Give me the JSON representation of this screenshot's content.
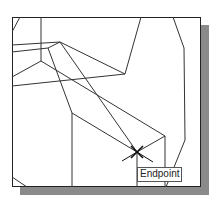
{
  "viewport": {
    "background": "#ffffff",
    "frame_color": "#222222",
    "shadow_color": "#8a8a8a"
  },
  "osnap": {
    "tooltip_label": "Endpoint",
    "cursor_icon": "snap-cross-cursor-icon"
  },
  "drawing": {
    "line_color": "#333333",
    "lines": [
      [
        41,
        17,
        41,
        61
      ],
      [
        20,
        17,
        12,
        32
      ],
      [
        12,
        45,
        60,
        42
      ],
      [
        12,
        52,
        48,
        48
      ],
      [
        48,
        48,
        60,
        42
      ],
      [
        41,
        61,
        12,
        77
      ],
      [
        41,
        61,
        165,
        136
      ],
      [
        48,
        48,
        72,
        113
      ],
      [
        72,
        113,
        72,
        187
      ],
      [
        72,
        113,
        137,
        152
      ],
      [
        60,
        42,
        125,
        74
      ],
      [
        125,
        74,
        141,
        17
      ],
      [
        60,
        42,
        137,
        152
      ],
      [
        12,
        86,
        125,
        74
      ],
      [
        173,
        17,
        184,
        48
      ],
      [
        184,
        48,
        185,
        140
      ],
      [
        185,
        140,
        166,
        187
      ],
      [
        165,
        136,
        165,
        187
      ],
      [
        165,
        136,
        137,
        152
      ],
      [
        137,
        152,
        137,
        187
      ],
      [
        12,
        177,
        27,
        187
      ]
    ]
  }
}
